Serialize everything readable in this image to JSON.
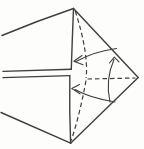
{
  "canvas": {
    "width": 144,
    "height": 149,
    "background": "#fdfdfb",
    "ink": "#3f3f3f"
  },
  "diagram": {
    "kind": "origami-fold-step-line-drawing",
    "solid_edges": [
      {
        "name": "upper-left-paper-edge",
        "d": "M2,35.5 Q38,20.5 73.5,8.5"
      },
      {
        "name": "upper-flap-right-edge",
        "d": "M73.5,8.5 Q72.2,40 71.3,69.3"
      },
      {
        "name": "slit-upper-line",
        "d": "M3,71.4 L71.3,69.3"
      },
      {
        "name": "slit-lower-line",
        "d": "M3,77.6 L69.8,75.6"
      },
      {
        "name": "lower-flap-right-edge",
        "d": "M69.8,75.6 Q69.3,110 70.6,143.2"
      },
      {
        "name": "lower-left-paper-edge",
        "d": "M1,112.5 L70.6,143.2"
      },
      {
        "name": "upper-right-paper-edge",
        "d": "M73.5,8.5 L138.2,77.6"
      },
      {
        "name": "lower-right-paper-edge",
        "d": "M138.2,77.6 L70.6,143.2"
      }
    ],
    "creases": [
      {
        "name": "upper-valley-crease",
        "d": "M75.2,11 Q88.5,52 86.2,78"
      },
      {
        "name": "lower-valley-crease",
        "d": "M86,80.5 Q79.5,116 71.2,140.5"
      },
      {
        "name": "horizontal-valley-crease",
        "d": "M87.5,79 L135.5,78"
      }
    ],
    "arrows": [
      {
        "name": "upper-fold-arrow",
        "d": "M116.5,48.5 Q94,51.5 76,61.5 M82,55.5 L73.8,61.2 L83,64.8"
      },
      {
        "name": "lower-fold-arrow",
        "d": "M115,102 Q90,98 75,89.5 M79.5,84.5 L71.8,88.6 L80,93.8"
      },
      {
        "name": "right-fold-arrow",
        "d": "M110,102 Q105,80 114,59.5 M109.5,63 L114.3,57.2 L119,61.8"
      }
    ]
  }
}
